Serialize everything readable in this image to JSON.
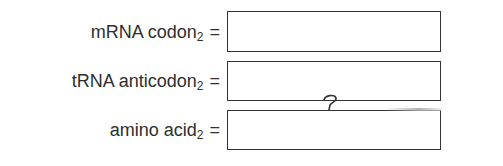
{
  "fields": [
    {
      "label_main": "mRNA codon",
      "label_sub": "2",
      "equals": "=",
      "value": ""
    },
    {
      "label_main": "tRNA anticodon",
      "label_sub": "2",
      "equals": "=",
      "value": ""
    },
    {
      "label_main": "amino acid",
      "label_sub": "2",
      "equals": "=",
      "value": ""
    }
  ],
  "annotation": {
    "handwritten_mark": "?"
  },
  "colors": {
    "text": "#2e2e2e",
    "box_border": "#333333",
    "background": "#ffffff"
  }
}
